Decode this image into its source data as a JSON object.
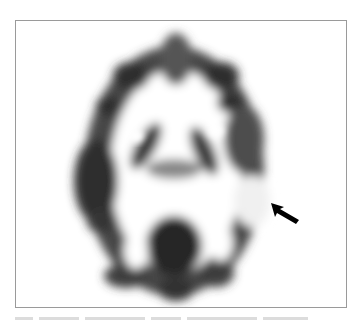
{
  "figure": {
    "type": "axial brain PET scan (grayscale)",
    "annotation": {
      "kind": "arrow",
      "direction": "up-left",
      "target": "right temporal hypometabolic region",
      "color": "#000000"
    },
    "frame_border_color": "#9a9a9a",
    "background_color": "#ffffff",
    "tissue_color": "#3a3a3a"
  }
}
